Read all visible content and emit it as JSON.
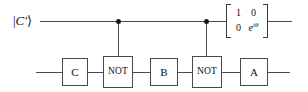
{
  "diagram": {
    "canvas": {
      "width": 308,
      "height": 92,
      "background": "#ffffff"
    },
    "line_color": "#4a4a4a",
    "dot_color": "#1a1a1a",
    "text_color": "#111111"
  },
  "wires": {
    "top": {
      "label_ket_open": "|",
      "label_symbol": "C'",
      "label_ket_close": "⟩",
      "y": 21
    },
    "bottom": {
      "y": 72
    }
  },
  "controls": [
    {
      "name": "control-1",
      "x": 118
    },
    {
      "name": "control-2",
      "x": 206
    }
  ],
  "gates": [
    {
      "id": "gate-c",
      "label": "C",
      "x": 62,
      "y": 58,
      "w": 26,
      "h": 28,
      "size": "normal"
    },
    {
      "id": "gate-not-1",
      "label": "NOT",
      "x": 103,
      "y": 56,
      "w": 30,
      "h": 32,
      "size": "small"
    },
    {
      "id": "gate-b",
      "label": "B",
      "x": 150,
      "y": 58,
      "w": 28,
      "h": 28,
      "size": "normal"
    },
    {
      "id": "gate-not-2",
      "label": "NOT",
      "x": 192,
      "y": 56,
      "w": 30,
      "h": 32,
      "size": "small"
    },
    {
      "id": "gate-a",
      "label": "A",
      "x": 240,
      "y": 58,
      "w": 28,
      "h": 28,
      "size": "normal"
    }
  ],
  "matrix": {
    "name": "phase-gate-matrix",
    "rows": [
      [
        "1",
        "0"
      ],
      [
        "0",
        "e^{iθ}"
      ]
    ],
    "cell_00": "1",
    "cell_01": "0",
    "cell_10": "0",
    "cell_11_base": "e",
    "cell_11_exp": "iθ",
    "x": 226,
    "y": 4,
    "w": 42,
    "h": 34
  }
}
